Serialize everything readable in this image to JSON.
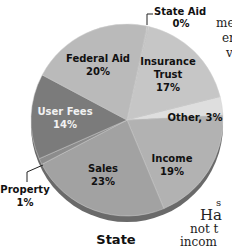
{
  "chart_data": {
    "type": "pie",
    "title": "State",
    "slices": [
      {
        "label": "State Aid",
        "value": 0,
        "display": "0%",
        "color": "#c4c4c4"
      },
      {
        "label": "Insurance Trust",
        "value": 17,
        "display": "17%",
        "color": "#c6c6c6"
      },
      {
        "label": "Other",
        "value": 3,
        "display": "3%",
        "color": "#dedede"
      },
      {
        "label": "Income",
        "value": 19,
        "display": "19%",
        "color": "#b2b2b2"
      },
      {
        "label": "Sales",
        "value": 23,
        "display": "23%",
        "color": "#a2a2a2"
      },
      {
        "label": "Property",
        "value": 1,
        "display": "1%",
        "color": "#8c8c8c"
      },
      {
        "label": "User Fees",
        "value": 14,
        "display": "14%",
        "color": "#7b7b7b"
      },
      {
        "label": "Federal Aid",
        "value": 20,
        "display": "20%",
        "color": "#bababa"
      }
    ],
    "legend_position": "none (inline labels)"
  },
  "labels": {
    "state_aid": [
      "State Aid",
      "0%"
    ],
    "insurance_trust": [
      "Insurance",
      "Trust",
      "17%"
    ],
    "other": "Other, 3%",
    "income": [
      "Income",
      "19%"
    ],
    "sales": [
      "Sales",
      "23%"
    ],
    "property": [
      "Property",
      "1%"
    ],
    "user_fees": [
      "User Fees",
      "14%"
    ],
    "federal_aid": [
      "Federal Aid",
      "20%"
    ]
  },
  "title": "State",
  "side_text": [
    "me",
    "er",
    "v",
    "s",
    "Ha",
    "not t",
    "incom"
  ]
}
